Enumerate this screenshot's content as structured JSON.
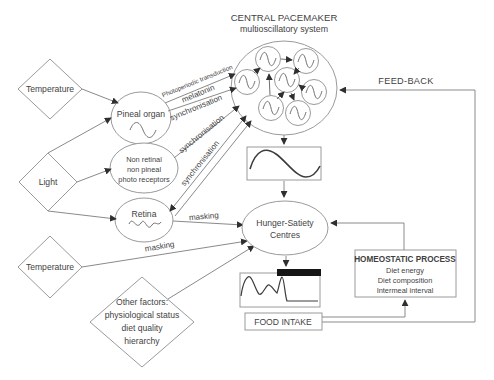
{
  "title": {
    "line1": "CENTRAL PACEMAKER",
    "line2": "multioscillatory system"
  },
  "nodes": {
    "temperature_top": "Temperature",
    "light": "Light",
    "temperature_bottom": "Temperature",
    "other_factors": {
      "line1": "Other factors:",
      "line2": "physiological status",
      "line3": "diet quality",
      "line4": "hierarchy"
    },
    "pineal_organ": "Pineal organ",
    "non_retinal": {
      "line1": "Non retinal",
      "line2": "non pineal",
      "line3": "photo receptors"
    },
    "retina": "Retina",
    "hunger_satiety": {
      "line1": "Hunger-Satiety",
      "line2": "Centres"
    },
    "homeostatic": {
      "title": "HOMEOSTATIC PROCESS",
      "item1": "Diet energy",
      "item2": "Diet composition",
      "item3": "Intermeal interval"
    },
    "food_intake": "FOOD INTAKE"
  },
  "edge_labels": {
    "feedback": "FEED-BACK",
    "photoperiodic_transduction": "Photoperiodic transduction",
    "melatonin": "melatonin",
    "synchronisation_pineal": "synchronisation",
    "synchronisation_non_retinal": "synchronisation",
    "synchronisation_retina": "synchronisation",
    "masking_retina": "masking",
    "masking_temperature": "masking"
  },
  "icons": {
    "oscillator": "sine-wave-icon",
    "pineal_wave": "sine-wave-icon",
    "retina_wave": "jagged-wave-icon",
    "rhythm_box": "sine-cycle-icon",
    "intake_plot": "meal-pattern-curve-icon"
  },
  "colors": {
    "background": "#ffffff",
    "node_stroke": "#9a9a9a",
    "line_stroke": "#8a8a8a",
    "arrow_fill": "#2f2f2f",
    "text": "#3f3f3f",
    "wave_stroke": "#3c3c3c",
    "bar_fill": "#161616"
  }
}
